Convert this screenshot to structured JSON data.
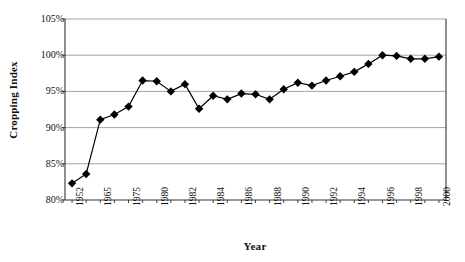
{
  "chart_data": {
    "type": "line",
    "title": "",
    "xlabel": "Year",
    "ylabel": "Cropping Index",
    "ylim": [
      80,
      105
    ],
    "y_ticks": [
      "80%",
      "85%",
      "90%",
      "95%",
      "100%",
      "105%"
    ],
    "y_tick_values": [
      80,
      85,
      90,
      95,
      100,
      105
    ],
    "grid": true,
    "legend": "none",
    "marker": "filled-diamond",
    "x_tick_labels": [
      "1952",
      "1965",
      "1975",
      "1980",
      "1982",
      "1984",
      "1986",
      "1988",
      "1990",
      "1992",
      "1994",
      "1996",
      "1998",
      "2000"
    ],
    "x_tick_indices": [
      0,
      2,
      4,
      6,
      8,
      10,
      12,
      14,
      16,
      18,
      20,
      22,
      24,
      26
    ],
    "x": [
      "1952",
      "1960",
      "1965",
      "1970",
      "1975",
      "1978",
      "1980",
      "1981",
      "1982",
      "1983",
      "1984",
      "1985",
      "1986",
      "1987",
      "1988",
      "1989",
      "1990",
      "1991",
      "1992",
      "1993",
      "1994",
      "1995",
      "1996",
      "1997",
      "1998",
      "1999",
      "2000"
    ],
    "values": [
      82.3,
      83.6,
      91.1,
      91.8,
      92.9,
      96.5,
      96.4,
      95.0,
      96.0,
      92.6,
      94.4,
      93.9,
      94.7,
      94.6,
      93.9,
      95.3,
      96.2,
      95.8,
      96.5,
      97.1,
      97.7,
      98.8,
      100.0,
      99.9,
      99.5,
      99.5,
      99.8
    ],
    "series_name": "Cropping Index"
  },
  "axis": {
    "y_title": "Cropping Index",
    "x_title": "Year"
  }
}
